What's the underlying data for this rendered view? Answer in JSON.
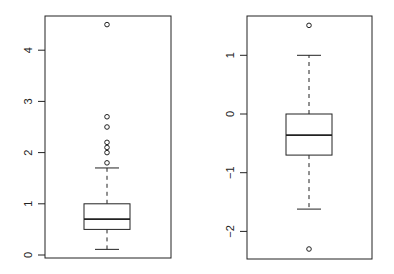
{
  "chart_data": [
    {
      "type": "box",
      "title": "",
      "xlabel": "",
      "ylabel": "",
      "ylim": [
        -0.05,
        4.7
      ],
      "y_ticks": [
        0,
        1,
        2,
        3,
        4
      ],
      "y_tick_labels": [
        "0",
        "1",
        "2",
        "3",
        "4"
      ],
      "grid": false,
      "box": {
        "whisker_low": 0.11,
        "q1": 0.5,
        "median": 0.7,
        "q3": 1.0,
        "whisker_high": 1.7,
        "outliers": [
          1.8,
          2.0,
          2.1,
          2.2,
          2.5,
          2.7,
          4.5
        ]
      }
    },
    {
      "type": "box",
      "title": "",
      "xlabel": "",
      "ylabel": "",
      "ylim": [
        -2.45,
        1.7
      ],
      "y_ticks": [
        -2,
        -1,
        0,
        1
      ],
      "y_tick_labels": [
        "-2",
        "-1",
        "0",
        "1"
      ],
      "grid": false,
      "box": {
        "whisker_low": -1.62,
        "q1": -0.7,
        "median": -0.36,
        "q3": 0.0,
        "whisker_high": 1.0,
        "outliers": [
          -2.3,
          1.51
        ]
      }
    }
  ],
  "colors": {
    "stroke": "#222222",
    "background": "#ffffff"
  }
}
